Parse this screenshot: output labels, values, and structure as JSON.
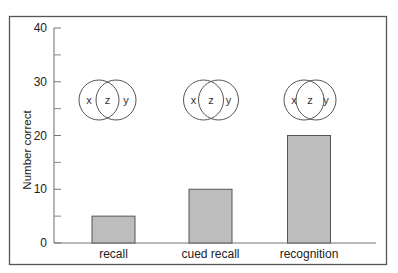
{
  "chart_data": {
    "type": "bar",
    "title": "",
    "xlabel": "",
    "ylabel": "Number correct",
    "categories": [
      "recall",
      "cued recall",
      "recognition"
    ],
    "values": [
      5,
      10,
      20
    ],
    "ylim": [
      0,
      40
    ],
    "yticks": [
      0,
      10,
      20,
      30,
      40
    ],
    "minor_yticks": [
      5,
      15,
      25,
      35
    ],
    "grid": false,
    "legend": null,
    "bar_color": "#bdbdbd",
    "bar_edge_color": "#555555",
    "annotations": [
      {
        "type": "venn",
        "category": "recall",
        "labels": [
          "x",
          "z",
          "y"
        ],
        "overlap": "small"
      },
      {
        "type": "venn",
        "category": "cued recall",
        "labels": [
          "x",
          "z",
          "y"
        ],
        "overlap": "medium"
      },
      {
        "type": "venn",
        "category": "recognition",
        "labels": [
          "x",
          "z",
          "y"
        ],
        "overlap": "large"
      }
    ]
  }
}
